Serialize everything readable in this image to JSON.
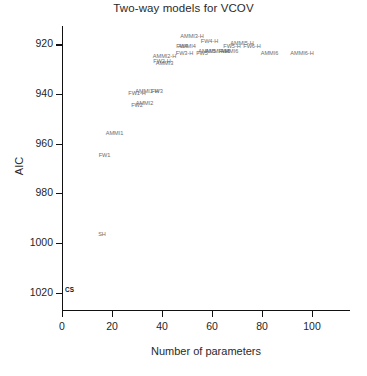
{
  "chart_data": {
    "type": "scatter",
    "title": "Two-way models for VCOV",
    "xlabel": "Number of parameters",
    "ylabel": "AIC",
    "xlim": [
      0,
      110
    ],
    "ylim": [
      1023,
      915
    ],
    "y_inverted": true,
    "grid": false,
    "legend": "none",
    "xticks": [
      0,
      20,
      40,
      60,
      80,
      100
    ],
    "yticks": [
      920,
      940,
      960,
      980,
      1000,
      1020
    ],
    "xtick_labels": [
      "0",
      "20",
      "40",
      "60",
      "80",
      "100"
    ],
    "ytick_labels": [
      "920",
      "940",
      "960",
      "980",
      "1000",
      "1020"
    ],
    "marker_style": "text-label",
    "points": [
      {
        "label": "CS",
        "x": 3,
        "y": 1019,
        "style": "bold"
      },
      {
        "label": "SH",
        "x": 16,
        "y": 997,
        "style": "dim"
      },
      {
        "label": "FW1",
        "x": 17,
        "y": 965,
        "style": "dim"
      },
      {
        "label": "AMMI1",
        "x": 21,
        "y": 956,
        "style": "dim"
      },
      {
        "label": "FW2",
        "x": 30,
        "y": 945,
        "style": "dim"
      },
      {
        "label": "AMMI2",
        "x": 33,
        "y": 944,
        "style": "dim"
      },
      {
        "label": "FW1-H",
        "x": 30,
        "y": 940,
        "style": "dim"
      },
      {
        "label": "AMMI1-H",
        "x": 34,
        "y": 939,
        "style": "dim"
      },
      {
        "label": "FW3",
        "x": 38,
        "y": 939,
        "style": "dim"
      },
      {
        "label": "AMMI3",
        "x": 41,
        "y": 928,
        "style": "dim"
      },
      {
        "label": "FW2-H",
        "x": 40,
        "y": 927,
        "style": "dim"
      },
      {
        "label": "AMMI2-H",
        "x": 41,
        "y": 925,
        "style": "dim"
      },
      {
        "label": "FW4",
        "x": 48,
        "y": 921,
        "style": "dim"
      },
      {
        "label": "AMMI4",
        "x": 50,
        "y": 921,
        "style": "dim"
      },
      {
        "label": "AMMI3-H",
        "x": 52,
        "y": 917,
        "style": "dim"
      },
      {
        "label": "FW3-H",
        "x": 49,
        "y": 924,
        "style": "dim"
      },
      {
        "label": "FW5",
        "x": 56,
        "y": 924,
        "style": "dim"
      },
      {
        "label": "AMMI5",
        "x": 58,
        "y": 923,
        "style": "dim"
      },
      {
        "label": "FW4-H",
        "x": 59,
        "y": 919,
        "style": "dim"
      },
      {
        "label": "AMMI4-H",
        "x": 62,
        "y": 923,
        "style": "dim"
      },
      {
        "label": "FW6",
        "x": 65,
        "y": 923,
        "style": "dim"
      },
      {
        "label": "AMMI6",
        "x": 67,
        "y": 923,
        "style": "dim"
      },
      {
        "label": "FW5-H",
        "x": 68,
        "y": 921,
        "style": "dim"
      },
      {
        "label": "AMMI5-H",
        "x": 72,
        "y": 920,
        "style": "dim"
      },
      {
        "label": "FW6-H",
        "x": 76,
        "y": 921,
        "style": "dim"
      },
      {
        "label": "AMMI6",
        "x": 83,
        "y": 924,
        "style": "dim"
      },
      {
        "label": "AMMI6-H",
        "x": 96,
        "y": 924,
        "style": "dim"
      }
    ]
  },
  "axes": {
    "x_title": "Number of parameters",
    "y_title": "AIC"
  }
}
